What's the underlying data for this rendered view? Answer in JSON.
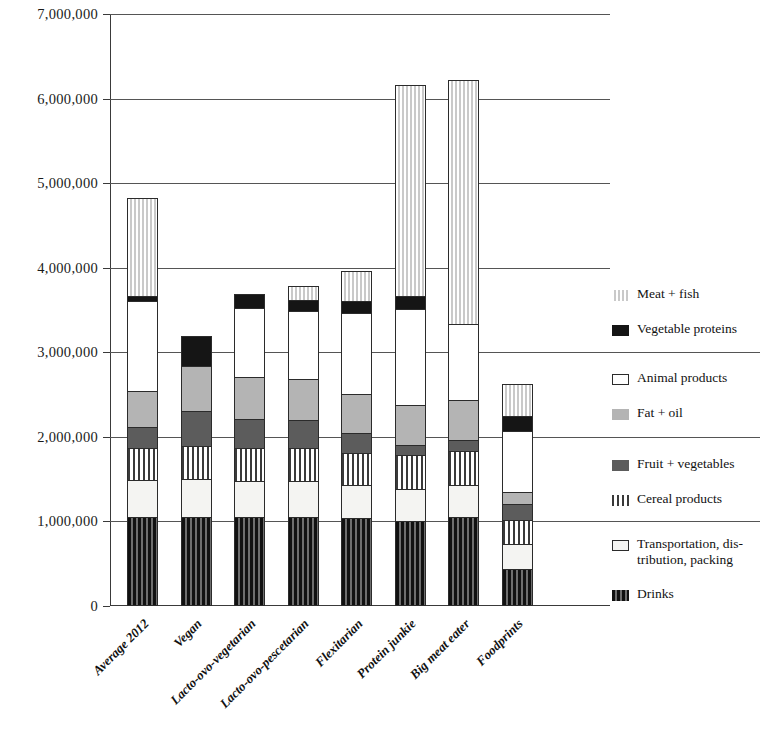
{
  "chart_data": {
    "type": "bar",
    "title": "",
    "xlabel": "",
    "ylabel": "",
    "stacked": true,
    "grid": true,
    "ylim": [
      0,
      7000000
    ],
    "ytick_labels": [
      "7,000,000",
      "6,000,000",
      "5,000,000",
      "4,000,000",
      "3,000,000",
      "2,000,000",
      "1,000,000",
      "0"
    ],
    "ytick_values": [
      7000000,
      6000000,
      5000000,
      4000000,
      3000000,
      2000000,
      1000000,
      0
    ],
    "categories": [
      "Average 2012",
      "Vegan",
      "Lacto-ovo-vegetarian",
      "Lacto-ovo-pescetarian",
      "Flexitarian",
      "Protein junkie",
      "Big meat eater",
      "Foodprints"
    ],
    "legend_position": "right",
    "series": [
      {
        "name": "Drinks",
        "key": "drinks",
        "values": [
          1050000,
          1050000,
          1050000,
          1050000,
          1030000,
          1000000,
          1050000,
          430000
        ]
      },
      {
        "name": "Transportation, distribution, packing",
        "key": "transport",
        "values": [
          430000,
          450000,
          420000,
          420000,
          400000,
          380000,
          380000,
          300000
        ]
      },
      {
        "name": "Cereal products",
        "key": "cereal",
        "values": [
          380000,
          390000,
          400000,
          400000,
          380000,
          400000,
          400000,
          290000
        ]
      },
      {
        "name": "Fruit + vegetables",
        "key": "fruit",
        "values": [
          250000,
          420000,
          340000,
          330000,
          240000,
          120000,
          130000,
          180000
        ]
      },
      {
        "name": "Fat + oil",
        "key": "fat",
        "values": [
          430000,
          540000,
          500000,
          490000,
          460000,
          470000,
          470000,
          150000
        ]
      },
      {
        "name": "Animal products",
        "key": "animal",
        "values": [
          1070000,
          0,
          820000,
          810000,
          960000,
          1140000,
          900000,
          730000
        ]
      },
      {
        "name": "Vegetable proteins",
        "key": "vegprot",
        "values": [
          60000,
          340000,
          160000,
          130000,
          150000,
          160000,
          0,
          180000
        ]
      },
      {
        "name": "Meat + fish",
        "key": "meat",
        "values": [
          1160000,
          0,
          0,
          150000,
          340000,
          2490000,
          2890000,
          370000
        ]
      }
    ],
    "totals": [
      4830000,
      3190000,
      3690000,
      3780000,
      3960000,
      6160000,
      6220000,
      2630000
    ]
  },
  "legend": {
    "groups": [
      {
        "items": [
          {
            "label": "Meat + fish",
            "swatch": "meat-swatch",
            "key": "meat"
          },
          {
            "label": "Vegetable proteins",
            "swatch": "vegetable-proteins-swatch",
            "key": "vegprot"
          }
        ]
      },
      {
        "items": [
          {
            "label": "Animal products",
            "swatch": "animal-products-swatch",
            "key": "animal"
          },
          {
            "label": "Fat + oil",
            "swatch": "fat-oil-swatch",
            "key": "fat"
          }
        ]
      },
      {
        "items": [
          {
            "label": "Fruit + vegetables",
            "swatch": "fruit-vegetables-swatch",
            "key": "fruit"
          },
          {
            "label": "Cereal products",
            "swatch": "cereal-products-swatch",
            "key": "cereal"
          }
        ]
      },
      {
        "items": [
          {
            "label": "Transportation, dis-⁠tribution, packing",
            "swatch": "transportation-swatch",
            "key": "transport"
          },
          {
            "label": "Drinks",
            "swatch": "drinks-swatch",
            "key": "drinks"
          }
        ]
      }
    ],
    "flat": [
      {
        "label": "Meat + fish",
        "key": "meat"
      },
      {
        "label": "Vegetable proteins",
        "key": "vegprot"
      },
      {
        "label": "Animal products",
        "key": "animal"
      },
      {
        "label": "Fat + oil",
        "key": "fat"
      },
      {
        "label": "Fruit + vegetables",
        "key": "fruit"
      },
      {
        "label": "Cereal products",
        "key": "cereal"
      },
      {
        "label": "Transportation, dis-",
        "key": "transport"
      },
      {
        "label": "tribution, packing",
        "key": "transport2"
      },
      {
        "label": "Drinks",
        "key": "drinks"
      }
    ]
  },
  "colors": {
    "axis": "#3a3a3a",
    "grid": "#555555",
    "meat": "#dedede",
    "vegprot": "#151515",
    "animal": "#ffffff",
    "fat": "#b4b4b4",
    "fruit": "#5c5c5c",
    "cereal": "#3a3a3a",
    "transport": "#f4f4f2",
    "drinks": "#2d2d2d",
    "background": "#ffffff"
  }
}
